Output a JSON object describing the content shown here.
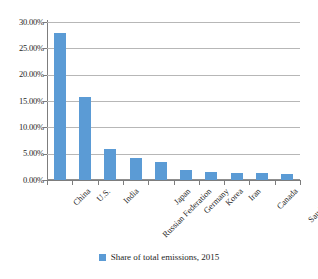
{
  "chart_data": {
    "type": "bar",
    "title": "",
    "subtitle": "",
    "xlabel": "",
    "ylabel": "",
    "categories": [
      "China",
      "U.S.",
      "India",
      "Russian Federation",
      "Japan",
      "Germany",
      "Korea",
      "Iran",
      "Canada",
      "Saudi Arabia"
    ],
    "values": [
      28.0,
      15.8,
      6.0,
      4.3,
      3.4,
      2.0,
      1.5,
      1.35,
      1.3,
      1.2
    ],
    "series": [
      {
        "name": "Share of total emissions, 2015",
        "values": [
          28.0,
          15.8,
          6.0,
          4.3,
          3.4,
          2.0,
          1.5,
          1.35,
          1.3,
          1.2
        ]
      }
    ],
    "ylim": [
      0,
      30
    ],
    "ytick_values": [
      0,
      5,
      10,
      15,
      20,
      25,
      30
    ],
    "ytick_labels": [
      "0.00%",
      "5.00%",
      "10.00%",
      "15.00%",
      "20.00%",
      "25.00%",
      "30.00%"
    ],
    "grid": true,
    "grid_axis": "y",
    "legend_position": "bottom",
    "bar_color": "#5b9bd5",
    "gridline_color": "#b7b7b7",
    "axis_color": "#7d7d7d",
    "background_color": "#ffffff"
  },
  "legend": {
    "entries": [
      {
        "label": "Share of total emissions, 2015",
        "color": "#5b9bd5"
      }
    ]
  }
}
